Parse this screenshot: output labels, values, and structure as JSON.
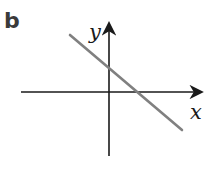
{
  "panel": {
    "label": "b"
  },
  "axes": {
    "x_label": "x",
    "y_label": "y",
    "origin": [
      109,
      92
    ],
    "x_axis": {
      "start": [
        21,
        92
      ],
      "end": [
        203,
        92
      ]
    },
    "y_axis": {
      "start": [
        109,
        156
      ],
      "end": [
        109,
        22
      ]
    }
  },
  "line": {
    "start": [
      70,
      35
    ],
    "end": [
      182,
      130
    ],
    "color": "#808080",
    "description": "Straight line with negative gradient and positive y-intercept"
  },
  "colors": {
    "axis": "#1a1a1a",
    "line": "#808080",
    "label": "#3a3a3a"
  }
}
